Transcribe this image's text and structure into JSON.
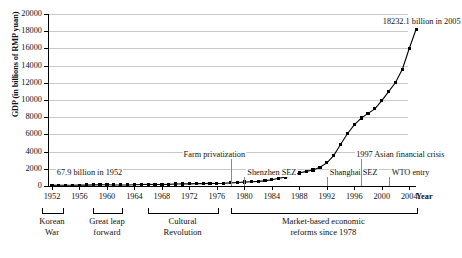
{
  "chart_data": {
    "type": "line",
    "title": "",
    "xlabel": "Year",
    "ylabel": "GDP (in billions of RMP yuan)",
    "ylim": [
      0,
      20000
    ],
    "xlim": [
      1952,
      2005
    ],
    "grid": true,
    "legend": "none",
    "ytick_labels": [
      "0",
      "2000",
      "4000",
      "6000",
      "8000",
      "10000",
      "12000",
      "14000",
      "16000",
      "18000",
      "20000"
    ],
    "ytick_values": [
      0,
      2000,
      4000,
      6000,
      8000,
      10000,
      12000,
      14000,
      16000,
      18000,
      20000
    ],
    "xtick_labels": [
      "1952",
      "1956",
      "1960",
      "1964",
      "1968",
      "1972",
      "1976",
      "1980",
      "1984",
      "1988",
      "1992",
      "1996",
      "2000",
      "2004"
    ],
    "xtick_values": [
      1952,
      1956,
      1960,
      1964,
      1968,
      1972,
      1976,
      1980,
      1984,
      1988,
      1992,
      1996,
      2000,
      2004
    ],
    "series": [
      {
        "name": "China GDP",
        "marker": "square",
        "color": "#000000",
        "x": [
          1952,
          1953,
          1954,
          1955,
          1956,
          1957,
          1958,
          1959,
          1960,
          1961,
          1962,
          1963,
          1964,
          1965,
          1966,
          1967,
          1968,
          1969,
          1970,
          1971,
          1972,
          1973,
          1974,
          1975,
          1976,
          1977,
          1978,
          1979,
          1980,
          1981,
          1982,
          1983,
          1984,
          1985,
          1986,
          1987,
          1988,
          1989,
          1990,
          1991,
          1992,
          1993,
          1994,
          1995,
          1996,
          1997,
          1998,
          1999,
          2000,
          2001,
          2002,
          2003,
          2004,
          2005
        ],
        "values": [
          67.9,
          82.4,
          85.9,
          91.0,
          102.8,
          106.8,
          130.7,
          143.9,
          145.7,
          122.0,
          114.9,
          123.3,
          145.4,
          171.6,
          186.8,
          177.4,
          172.3,
          193.8,
          225.3,
          242.6,
          251.8,
          272.1,
          279.0,
          299.7,
          294.4,
          320.2,
          364.5,
          406.3,
          454.6,
          489.2,
          532.3,
          596.3,
          720.8,
          901.6,
          1027.5,
          1205.9,
          1504.4,
          1699.2,
          1866.8,
          2178.2,
          2692.4,
          3533.4,
          4819.8,
          6079.4,
          7117.7,
          7897.3,
          8440.2,
          8967.7,
          9921.5,
          10965.5,
          12033.3,
          13582.3,
          15987.8,
          18232.1
        ]
      }
    ],
    "annotations": [
      {
        "id": "start-value",
        "text": "67.9 billion in 1952",
        "x": 1957.5,
        "y": 1500
      },
      {
        "id": "end-value",
        "text": "18232.1 billion in 2005",
        "x": 2000,
        "y": 19100
      },
      {
        "id": "farm-privatization",
        "text": "Farm privatization",
        "x": 1978,
        "y": 3600
      },
      {
        "id": "shenzhen-sez",
        "text": "Shenzhen SEZ",
        "x": 1980,
        "y": 1500
      },
      {
        "id": "shanghai-sez",
        "text": "Shanghai SEZ",
        "x": 1992,
        "y": 1500
      },
      {
        "id": "asian-crisis",
        "text": "1997 Asian financial crisis",
        "x": 1997,
        "y": 3600
      },
      {
        "id": "wto-entry",
        "text": "WTO entry",
        "x": 2001,
        "y": 1500
      }
    ],
    "eras": [
      {
        "id": "korean-war",
        "label": "Korean\nWar",
        "start": 1950.5,
        "end": 1953.5,
        "center": 1952
      },
      {
        "id": "great-leap-forward",
        "label": "Great leap\nforward",
        "start": 1958,
        "end": 1962,
        "center": 1960
      },
      {
        "id": "cultural-revolution",
        "label": "Cultural\nRevolution",
        "start": 1966,
        "end": 1976,
        "center": 1971
      },
      {
        "id": "market-reforms",
        "label": "Market-based economic\nreforms since 1978",
        "start": 1978,
        "end": 2005,
        "center": 1991.5
      }
    ]
  },
  "colors": {
    "grid": "#c9c9c9",
    "axis": "#000000",
    "series": "#000000",
    "background": "#ffffff"
  }
}
